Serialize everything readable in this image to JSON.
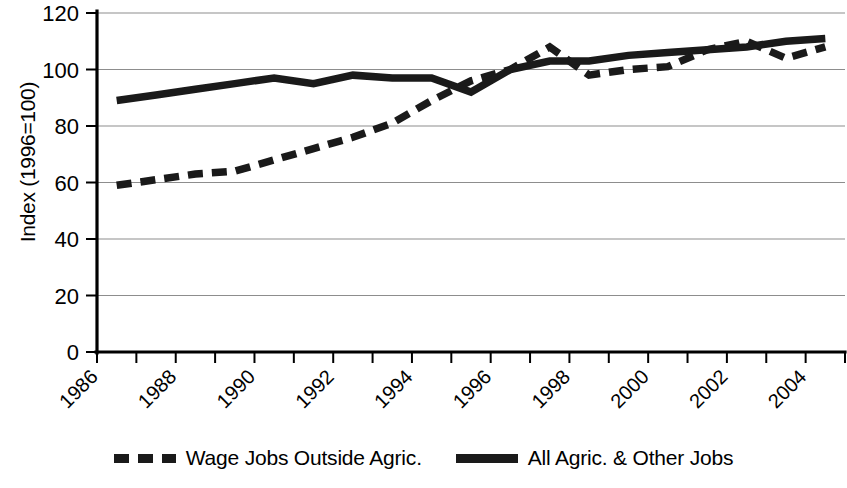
{
  "chart_data": {
    "type": "line",
    "title": "",
    "subtitle": "",
    "xlabel": "",
    "ylabel": "Index (1996=100)",
    "x": [
      1986,
      1987,
      1988,
      1989,
      1990,
      1991,
      1992,
      1993,
      1994,
      1995,
      1996,
      1997,
      1998,
      1999,
      2000,
      2001,
      2002,
      2003,
      2004
    ],
    "xtick_labels": [
      "1986",
      "1988",
      "1990",
      "1992",
      "1994",
      "1996",
      "1998",
      "2000",
      "2002",
      "2004"
    ],
    "xtick_values": [
      1986,
      1988,
      1990,
      1992,
      1994,
      1996,
      1998,
      2000,
      2002,
      2004
    ],
    "ytick_labels": [
      "0",
      "20",
      "40",
      "60",
      "80",
      "100",
      "120"
    ],
    "ytick_values": [
      0,
      20,
      40,
      60,
      80,
      100,
      120
    ],
    "ylim": [
      0,
      120
    ],
    "xlim": [
      1985.5,
      2004.5
    ],
    "grid": "horizontal",
    "legend_position": "bottom",
    "series": [
      {
        "name": "Wage Jobs Outside Agric.",
        "style": "dashed",
        "color": "#1a1a1a",
        "values": [
          59,
          61,
          63,
          64,
          68,
          72,
          76,
          81,
          89,
          96,
          100,
          108,
          98,
          100,
          101,
          107,
          110,
          104,
          108
        ]
      },
      {
        "name": "All Agric. & Other Jobs",
        "style": "solid",
        "color": "#1a1a1a",
        "values": [
          89,
          91,
          93,
          95,
          97,
          95,
          98,
          97,
          97,
          92,
          100,
          103,
          103,
          105,
          106,
          107,
          108,
          110,
          111
        ]
      }
    ]
  },
  "legend": {
    "entries": [
      {
        "label": "Wage Jobs Outside Agric.",
        "style": "dashed"
      },
      {
        "label": "All Agric. & Other Jobs",
        "style": "solid"
      }
    ]
  },
  "axis": {
    "y_title": "Index (1996=100)"
  }
}
